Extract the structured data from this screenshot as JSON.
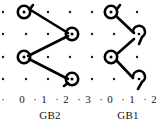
{
  "figure": {
    "background_color": "#ffffff",
    "ink_color": "#000000",
    "lattice_dot_color": "#1a1a1a"
  },
  "panels": [
    {
      "id": "gb2",
      "caption": "GB2",
      "tick_labels": [
        "0",
        "1",
        "2",
        "3"
      ]
    },
    {
      "id": "gb1",
      "caption": "GB1",
      "tick_labels": [
        "0",
        "1",
        "2"
      ]
    }
  ],
  "axis": {
    "sequence": [
      "·",
      "0",
      "·",
      "1",
      "·",
      "2",
      "·",
      "3",
      "·",
      "0",
      "·",
      "1",
      "·",
      "2"
    ],
    "separator_glyph": "·",
    "labels": [
      "0",
      "1",
      "2",
      "3",
      "0",
      "1",
      "2"
    ]
  },
  "lattice": {
    "dot_rows_y": [
      12,
      34,
      56,
      78
    ],
    "dot_cols_x": [
      3,
      23,
      43,
      63,
      83,
      103,
      123,
      143
    ],
    "dot_radius": 1.2
  },
  "gb2_diagram": {
    "type": "chevron-with-loops",
    "nodes": [
      {
        "name": "node-top-left",
        "x": 26,
        "y": 12,
        "marker": "loop-circle"
      },
      {
        "name": "node-right-mid",
        "x": 70,
        "y": 34,
        "marker": "loop-circle"
      },
      {
        "name": "node-left-lower",
        "x": 26,
        "y": 57,
        "marker": "loop-circle"
      },
      {
        "name": "node-bottom-right",
        "x": 70,
        "y": 79,
        "marker": "loop-circle"
      }
    ],
    "strokes": [
      "top-left to right-mid",
      "right-mid to left-lower",
      "left-lower to bottom-right"
    ]
  },
  "gb1_diagram": {
    "type": "chevron-with-hooks",
    "nodes": [
      {
        "name": "node-top-left",
        "x": 114,
        "y": 12,
        "marker": "loop-circle"
      },
      {
        "name": "node-right-mid",
        "x": 140,
        "y": 34,
        "marker": "hook-curl"
      },
      {
        "name": "node-left-lower",
        "x": 112,
        "y": 57,
        "marker": "loop-circle"
      },
      {
        "name": "node-bottom-right",
        "x": 140,
        "y": 79,
        "marker": "hook-curl"
      }
    ],
    "strokes": [
      "top-left to right-mid",
      "right-mid to left-lower",
      "left-lower to bottom-right"
    ]
  }
}
